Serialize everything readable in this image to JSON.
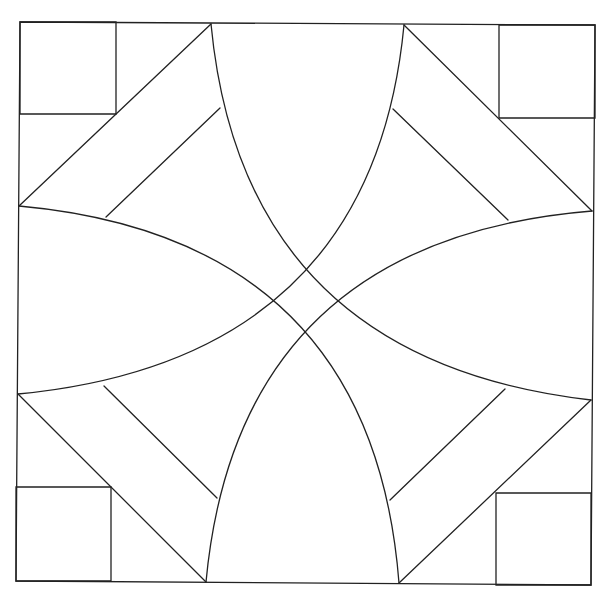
{
  "diagram": {
    "title": "",
    "stroke_color": "#222222",
    "background": "#ffffff",
    "border": [
      [
        20,
        22
      ],
      [
        595,
        25
      ],
      [
        591,
        585
      ],
      [
        16,
        581
      ]
    ],
    "corner_squares": [
      [
        [
          20,
          22
        ],
        [
          116,
          22
        ],
        [
          116,
          114
        ],
        [
          20,
          114
        ]
      ],
      [
        [
          499,
          25
        ],
        [
          595,
          25
        ],
        [
          595,
          118
        ],
        [
          499,
          118
        ]
      ],
      [
        [
          16,
          487
        ],
        [
          111,
          487
        ],
        [
          111,
          581
        ],
        [
          16,
          581
        ]
      ],
      [
        [
          496,
          493
        ],
        [
          591,
          493
        ],
        [
          591,
          585
        ],
        [
          496,
          585
        ]
      ]
    ],
    "diagonals": [
      [
        [
          211,
          24
        ],
        [
          19,
          206
        ]
      ],
      [
        [
          404,
          25
        ],
        [
          592,
          211
        ]
      ],
      [
        [
          18,
          394
        ],
        [
          206,
          582
        ]
      ],
      [
        [
          591,
          400
        ],
        [
          399,
          583
        ]
      ]
    ],
    "inner_lines": [
      [
        [
          220,
          108
        ],
        [
          106,
          217
        ]
      ],
      [
        [
          393,
          109
        ],
        [
          508,
          220
        ]
      ],
      [
        [
          104,
          386
        ],
        [
          217,
          498
        ]
      ],
      [
        [
          505,
          389
        ],
        [
          390,
          500
        ]
      ]
    ],
    "arcs": [
      {
        "from": [
          211,
          24
        ],
        "control": [
          243,
          360
        ],
        "to": [
          591,
          400
        ]
      },
      {
        "from": [
          404,
          25
        ],
        "control": [
          372,
          360
        ],
        "to": [
          18,
          394
        ]
      },
      {
        "from": [
          19,
          206
        ],
        "control": [
          372,
          238
        ],
        "to": [
          399,
          583
        ]
      },
      {
        "from": [
          592,
          211
        ],
        "control": [
          238,
          240
        ],
        "to": [
          206,
          582
        ]
      }
    ]
  }
}
